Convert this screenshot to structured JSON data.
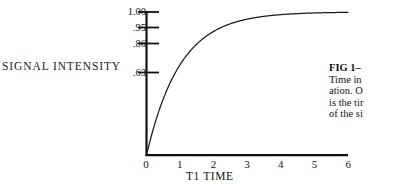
{
  "chart_data": {
    "type": "line",
    "title": "",
    "xlabel": "T1 TIME",
    "ylabel": "SIGNAL INTENSITY",
    "xlim": [
      0,
      6
    ],
    "ylim": [
      0,
      1.0
    ],
    "grid": false,
    "legend": null,
    "x_ticks": [
      "0",
      "1",
      "2",
      "3",
      "4",
      "5",
      "6"
    ],
    "x_tick_values": [
      0,
      1,
      2,
      3,
      4,
      5,
      6
    ],
    "y_ticks": [
      "1.00",
      ".95",
      ".86",
      ".63"
    ],
    "y_tick_values": [
      1.0,
      0.95,
      0.86,
      0.63
    ],
    "series": [
      {
        "name": "T1 recovery",
        "equation": "1 - e^(-t)",
        "x": [
          0,
          0.1,
          0.2,
          0.3,
          0.4,
          0.5,
          0.6,
          0.8,
          1.0,
          1.2,
          1.5,
          2.0,
          2.5,
          3.0,
          3.5,
          4.0,
          4.5,
          5.0,
          5.5,
          6.0
        ],
        "y": [
          0,
          0.095,
          0.181,
          0.259,
          0.33,
          0.393,
          0.451,
          0.551,
          0.632,
          0.699,
          0.777,
          0.865,
          0.918,
          0.95,
          0.97,
          0.982,
          0.989,
          0.993,
          0.996,
          0.998
        ]
      }
    ]
  },
  "axis_labels": {
    "y_title": "SIGNAL INTENSITY",
    "x_title": "T1 TIME"
  },
  "caption": {
    "head": "FIG 1–",
    "lines": [
      "Time in",
      "ation. O",
      "is the tir",
      "of the si"
    ]
  },
  "colors": {
    "background": "#ffffff",
    "ink": "#111111",
    "curve": "#1a1a1a"
  }
}
